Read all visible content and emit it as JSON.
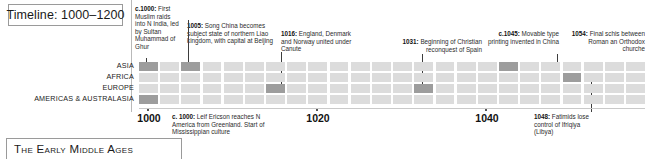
{
  "title": {
    "label": "Timeline: 1000–1200"
  },
  "footer": {
    "label": "The Early Middle Ages"
  },
  "rows": [
    {
      "key": "asia",
      "label": "ASIA"
    },
    {
      "key": "africa",
      "label": "AFRICA"
    },
    {
      "key": "europe",
      "label": "EUROPE"
    },
    {
      "key": "americas",
      "label": "AMERICAS & AUSTRALASIA"
    }
  ],
  "axis": {
    "start_year": 1000,
    "end_year": 1060,
    "decades": [
      "1000",
      "1020",
      "1040"
    ],
    "decade_years": [
      1000,
      1020,
      1040
    ]
  },
  "events_top": [
    {
      "id": "e1000-india",
      "year_label": "c.1000:",
      "text": "First Muslim raids into N India, led by Sultan Muhammad of Ghur",
      "row": "asia",
      "align": "left"
    },
    {
      "id": "e1005-song",
      "year_label": "1005:",
      "text": "Song China becomes subject state of northern Liao kingdom, with capital at Beijing",
      "row": "asia",
      "align": "left"
    },
    {
      "id": "e1016-canute",
      "year_label": "1016:",
      "text": "England, Denmark and Norway united under Canute",
      "row": "europe",
      "align": "left"
    },
    {
      "id": "e1031-spain",
      "year_label": "1031:",
      "text": "Beginning of Christian reconquest of Spain",
      "row": "europe",
      "align": "left"
    },
    {
      "id": "e1045-printing",
      "year_label": "c.1045:",
      "text": "Movable type printing invented in China",
      "row": "asia",
      "align": "right"
    },
    {
      "id": "e1054-schism",
      "year_label": "1054:",
      "text": "Final schis between Roman an Orthodox churche",
      "row": "africa",
      "align": "right"
    }
  ],
  "events_bottom": [
    {
      "id": "e1000-ericson",
      "year_label": "c. 1000:",
      "text": "Leif Ericson reaches N America from Greenland. Start of Mississippian culture",
      "row": "americas"
    },
    {
      "id": "e1048-fatimids",
      "year_label": "1048:",
      "text": "Fatimids lose control of Ifriqiya (Libya)",
      "row": "africa"
    }
  ],
  "colors": {
    "cell": "#dcdcdc",
    "cell_highlight": "#9d9d9d",
    "border": "#9a9a9a",
    "leader": "#3d3d3d",
    "text": "#2b2b2b"
  },
  "grid": {
    "columns": 24,
    "highlighted": [
      {
        "row": 0,
        "col": 0
      },
      {
        "row": 0,
        "col": 2
      },
      {
        "row": 0,
        "col": 17
      },
      {
        "row": 1,
        "col": 20
      },
      {
        "row": 2,
        "col": 6
      },
      {
        "row": 2,
        "col": 13
      },
      {
        "row": 3,
        "col": 0
      }
    ]
  }
}
